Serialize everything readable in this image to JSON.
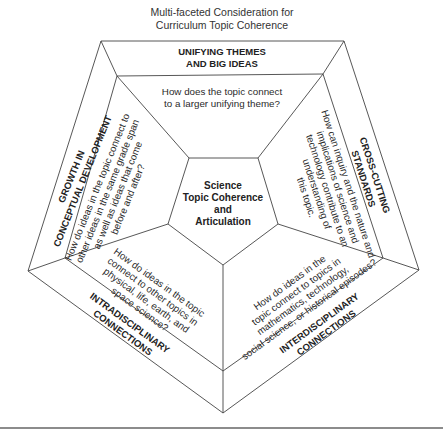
{
  "title": [
    "Multi-faceted Consideration for",
    "Curriculum Topic Coherence"
  ],
  "center": [
    "Science",
    "Topic Coherence",
    "and",
    "Articulation"
  ],
  "sections": {
    "top": {
      "heading": [
        "UNIFYING THEMES",
        "AND BIG IDEAS"
      ],
      "question": [
        "How does the topic connect",
        "to a larger unifying theme?"
      ]
    },
    "left": {
      "heading": [
        "GROWTH IN",
        "CONCEPTUAL DEVELOPMENT"
      ],
      "question": [
        "How do ideas in the topic connect to",
        "other ideas in the same grade span",
        "as well as ideas that come",
        "before and after?"
      ]
    },
    "right": {
      "heading": [
        "CROSS-CUTTING",
        "STANDARDS"
      ],
      "question": [
        "How can inquiry and the nature and",
        "implications of science and",
        "technology contribute to an",
        "understanding of",
        "this topic."
      ]
    },
    "bottom_left": {
      "heading": [
        "INTRADISCIPLINARY",
        "CONNECTIONS"
      ],
      "question": [
        "How do ideas in the topic",
        "connect to other topics in",
        "physical, life, earth, and",
        "space science?"
      ]
    },
    "bottom_right": {
      "heading": [
        "INTERDISCIPLINARY",
        "CONNECTIONS"
      ],
      "question": [
        "How do ideas in the",
        "topic connect to topics in",
        "mathematics, technology,",
        "social science, or historical episodes?"
      ]
    }
  }
}
